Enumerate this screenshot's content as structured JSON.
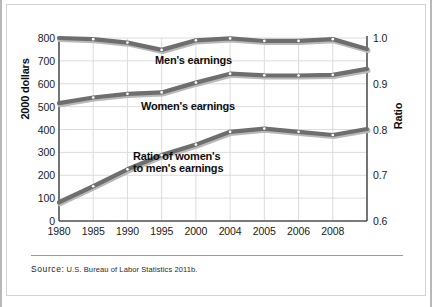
{
  "chart_data": {
    "type": "line",
    "title": "",
    "xlabel": "",
    "ylabel": "2000 dollars",
    "ylabel_right": "Ratio",
    "categories": [
      "1980",
      "1985",
      "1990",
      "1995",
      "2000",
      "2004",
      "2005",
      "2006",
      "2008",
      ""
    ],
    "ylim": [
      0,
      800
    ],
    "ylim_right": [
      0.6,
      1.0
    ],
    "yticks": [
      "800",
      "700",
      "600",
      "500",
      "400",
      "300",
      "200",
      "100",
      "0"
    ],
    "ytick_values": [
      800,
      700,
      600,
      500,
      400,
      300,
      200,
      100,
      0
    ],
    "yticks_right": [
      "1.0",
      "0.9",
      "0.8",
      "0.7",
      "0.6"
    ],
    "ytick_values_right": [
      1.0,
      0.9,
      0.8,
      0.7,
      0.6
    ],
    "grid": true,
    "legend": "inline-annotations",
    "series": [
      {
        "name": "Men's earnings",
        "axis": "left",
        "values": [
          800,
          795,
          780,
          748,
          790,
          798,
          787,
          787,
          795,
          752
        ]
      },
      {
        "name": "Women's earnings",
        "axis": "left",
        "values": [
          515,
          540,
          556,
          562,
          605,
          644,
          637,
          636,
          639,
          665
        ]
      },
      {
        "name": "Ratio of women's to men's earnings",
        "axis": "right",
        "values": [
          0.641,
          0.676,
          0.713,
          0.744,
          0.767,
          0.795,
          0.802,
          0.795,
          0.788,
          0.801
        ]
      }
    ],
    "annotations": [
      {
        "name": "men-series-label",
        "text": "Men's earnings"
      },
      {
        "name": "women-series-label",
        "text": "Women's earnings"
      },
      {
        "name": "ratio-series-label",
        "text": "Ratio of women's\nto men's earnings"
      }
    ],
    "colors": {
      "line": "#6e6e6e",
      "line_shadow": "#b9b9b9",
      "marker_fill": "#ffffff",
      "grid": "#dcdcdc",
      "axis": "#555555",
      "text": "#0d0d0d"
    }
  },
  "footer": {
    "source_label": "Source:",
    "source_text": "U.S. Bureau of Labor Statistics 2011b."
  }
}
